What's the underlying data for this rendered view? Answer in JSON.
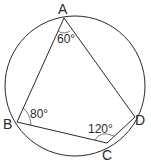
{
  "diagram": {
    "type": "cyclic-quadrilateral",
    "circle": {
      "cx": 75,
      "cy": 86,
      "r": 70
    },
    "points": {
      "A": {
        "label": "A",
        "x": 64,
        "y": 18,
        "lx": 58,
        "ly": 14
      },
      "B": {
        "label": "B",
        "x": 17,
        "y": 122,
        "lx": 3,
        "ly": 129
      },
      "C": {
        "label": "C",
        "x": 107,
        "y": 143,
        "lx": 102,
        "ly": 160
      },
      "D": {
        "label": "D",
        "x": 135,
        "y": 117,
        "lx": 135,
        "ly": 125
      }
    },
    "angles": {
      "A": {
        "label": "60°",
        "x": 57,
        "y": 43
      },
      "B": {
        "label": "80°",
        "x": 30,
        "y": 118
      },
      "C": {
        "label": "120°",
        "x": 88,
        "y": 133
      }
    },
    "colors": {
      "stroke": "#2a2a2a",
      "background": "#ffffff"
    }
  }
}
